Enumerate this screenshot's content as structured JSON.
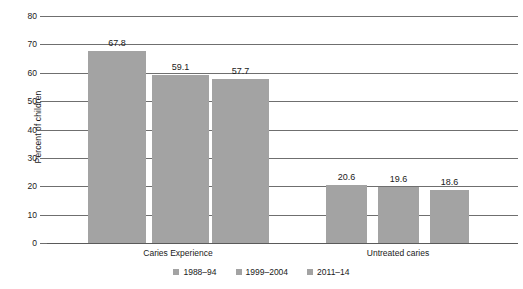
{
  "chart_data": {
    "type": "bar",
    "title": "",
    "xlabel": "",
    "ylabel": "Percent of children",
    "ylim": [
      0,
      80
    ],
    "yticks": [
      0,
      10,
      20,
      30,
      40,
      50,
      60,
      70,
      80
    ],
    "ytick_labels": [
      "0",
      "10",
      "20",
      "30",
      "40",
      "50",
      "60",
      "70",
      "80"
    ],
    "grid": true,
    "legend_position": "bottom-center",
    "categories": [
      "Caries Experience",
      "Untreated caries"
    ],
    "series": [
      {
        "name": "1988–94",
        "values": [
          67.8,
          20.6
        ],
        "color": "#a3a3a3"
      },
      {
        "name": "1999–2004",
        "values": [
          59.1,
          19.6
        ],
        "color": "#a3a3a3"
      },
      {
        "name": "2011–14",
        "values": [
          57.7,
          18.6
        ],
        "color": "#a3a3a3"
      }
    ],
    "data_labels": [
      "67.8",
      "59.1",
      "57.7",
      "20.6",
      "19.6",
      "18.6"
    ],
    "bar_color": "#a3a3a3",
    "axis_color": "#6f6f6f"
  },
  "axis": {
    "y_title": "Percent of children",
    "ticks": [
      {
        "label": "80",
        "value": 80
      },
      {
        "label": "70",
        "value": 70
      },
      {
        "label": "60",
        "value": 60
      },
      {
        "label": "50",
        "value": 50
      },
      {
        "label": "40",
        "value": 40
      },
      {
        "label": "30",
        "value": 30
      },
      {
        "label": "20",
        "value": 20
      },
      {
        "label": "10",
        "value": 10
      },
      {
        "label": "0",
        "value": 0
      }
    ]
  },
  "groups": [
    {
      "label": "Caries Experience",
      "bars": [
        {
          "series": "1988–94",
          "value": 67.8,
          "label": "67.8"
        },
        {
          "series": "1999–2004",
          "value": 59.1,
          "label": "59.1"
        },
        {
          "series": "2011–14",
          "value": 57.7,
          "label": "57.7"
        }
      ]
    },
    {
      "label": "Untreated caries",
      "bars": [
        {
          "series": "1988–94",
          "value": 20.6,
          "label": "20.6"
        },
        {
          "series": "1999–2004",
          "value": 19.6,
          "label": "19.6"
        },
        {
          "series": "2011–14",
          "value": 18.6,
          "label": "18.6"
        }
      ]
    }
  ],
  "legend": {
    "items": [
      {
        "label": "1988–94",
        "color": "#a3a3a3"
      },
      {
        "label": "1999–2004",
        "color": "#a3a3a3"
      },
      {
        "label": "2011–14",
        "color": "#a3a3a3"
      }
    ]
  }
}
